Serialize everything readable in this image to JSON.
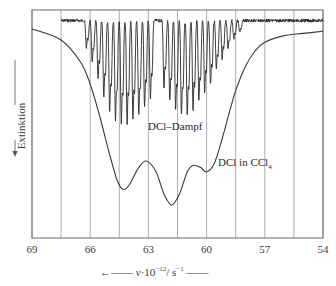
{
  "chart_data": {
    "type": "line",
    "title": "",
    "xlabel": "ν·10⁻¹²/s⁻¹",
    "ylabel": "Extinktion",
    "xlim": [
      69,
      54
    ],
    "x_reversed": true,
    "x_ticks": [
      69,
      66,
      63,
      60,
      57,
      54
    ],
    "grid_x": [
      69,
      67.5,
      66,
      64.5,
      63,
      61.5,
      60,
      58.5,
      57,
      55.5,
      54
    ],
    "grid": true,
    "y_ticks": [],
    "y_direction": "extinction increases downward",
    "series": [
      {
        "name": "DCl-Dampf",
        "style": "dense rotational absorption lines (P and R branches)",
        "x_range": [
          67.5,
          54
        ],
        "baseline": 0.03,
        "p_branch_x": [
          66.2,
          65.9,
          65.6,
          65.3,
          65.0,
          64.7,
          64.4,
          64.1,
          63.8,
          63.5,
          63.2,
          62.9
        ],
        "p_branch_depth": [
          0.12,
          0.18,
          0.26,
          0.34,
          0.4,
          0.44,
          0.46,
          0.46,
          0.44,
          0.42,
          0.38,
          0.34
        ],
        "r_branch_x": [
          62.2,
          61.9,
          61.6,
          61.3,
          61.0,
          60.7,
          60.4,
          60.1,
          59.8,
          59.5,
          59.2,
          58.9,
          58.6,
          58.3
        ],
        "r_branch_depth": [
          0.3,
          0.36,
          0.4,
          0.42,
          0.42,
          0.4,
          0.36,
          0.32,
          0.28,
          0.22,
          0.17,
          0.12,
          0.08,
          0.05
        ]
      },
      {
        "name": "DCl in CCl₄",
        "style": "smooth broad band",
        "x": [
          69,
          67.5,
          66.5,
          66,
          65.5,
          65,
          64.6,
          64.3,
          64,
          63.5,
          63.1,
          62.6,
          62.2,
          61.8,
          61.4,
          61,
          60.7,
          60.3,
          60,
          59.6,
          59.2,
          58.8,
          58.5,
          58,
          57.5,
          57,
          56,
          55,
          54
        ],
        "y": [
          0.05,
          0.1,
          0.2,
          0.3,
          0.45,
          0.62,
          0.74,
          0.78,
          0.76,
          0.68,
          0.65,
          0.7,
          0.8,
          0.85,
          0.8,
          0.7,
          0.67,
          0.68,
          0.7,
          0.66,
          0.55,
          0.42,
          0.33,
          0.22,
          0.15,
          0.11,
          0.08,
          0.07,
          0.06
        ]
      }
    ],
    "annotations": [
      {
        "text": "DCl–Dampf",
        "x": 63.2,
        "y": 0.48
      },
      {
        "text": "DCl in CCl₄",
        "x": 59.3,
        "y": 0.66
      }
    ]
  },
  "labels": {
    "ylabel_text": "Extinktion",
    "xlabel_nu": "ν",
    "xlabel_mid": "·10",
    "xlabel_exp": "−12",
    "xlabel_unit": "/ s",
    "xlabel_unit_exp": "−1",
    "arrow_left": "←——",
    "arrow_right": "——",
    "gas_label": "DCl–Dampf",
    "solution_label_main": "DCl in CCl",
    "solution_label_sub": "4",
    "ticks": [
      "69",
      "66",
      "63",
      "60",
      "57",
      "54"
    ]
  },
  "colors": {
    "grid": "#8a8a8a",
    "frame": "#6a6a6a",
    "curve": "#3a3a3a",
    "gas": "#2a2a2a"
  }
}
